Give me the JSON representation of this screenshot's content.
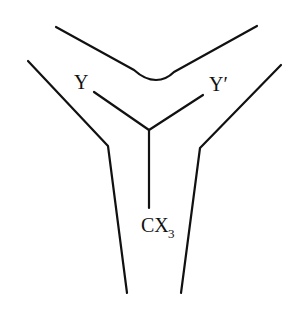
{
  "diagram": {
    "type": "Y-shaped channel with central three-way molecular junction",
    "labels": {
      "left_arm": "Y",
      "right_arm": "Y′",
      "stem_main": "CX",
      "stem_subscript": "3"
    },
    "colors": {
      "stroke": "#111111",
      "background": "#ffffff"
    }
  }
}
